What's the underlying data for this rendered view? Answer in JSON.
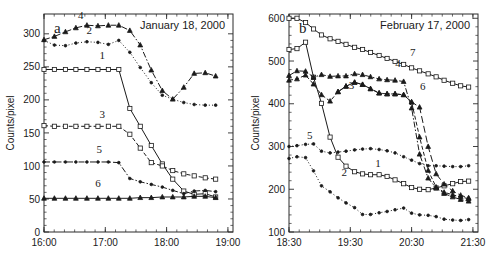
{
  "figure": {
    "background": "#ffffff",
    "ink_color": "#1a1a1a",
    "panel_count": 2
  },
  "chart_data": [
    {
      "type": "line",
      "panel_letter": "a",
      "title": "January 18, 2000",
      "xlabel": "",
      "ylabel": "Counts/pixel",
      "ylim": [
        0,
        330
      ],
      "yticks": [
        0,
        50,
        100,
        150,
        200,
        250,
        300
      ],
      "ytick_labels": [
        "0",
        "50",
        "100",
        "150",
        "200",
        "250",
        "300"
      ],
      "xlim": [
        "16:00",
        "19:05"
      ],
      "xticks": [
        "16:00",
        "17:00",
        "18:00",
        "19:00"
      ],
      "xtick_labels": [
        "16:00",
        "17:00",
        "18:00",
        "19:00"
      ],
      "xtick_hours": [
        16.0,
        17.0,
        18.0,
        19.0
      ],
      "xlim_hours": [
        16.0,
        19.083
      ],
      "grid": false,
      "legend": "inline-curve-numbers",
      "series": [
        {
          "name": "1",
          "label": "1",
          "style": "solid",
          "marker": "square",
          "label_pos": {
            "x": 16.95,
            "y": 262
          },
          "x": [
            16.0,
            16.17,
            16.35,
            16.52,
            16.7,
            16.88,
            17.05,
            17.22,
            17.4,
            17.57,
            17.75,
            17.93,
            18.1,
            18.28,
            18.45,
            18.63,
            18.8
          ],
          "y": [
            246,
            246,
            246,
            246,
            246,
            246,
            246,
            246,
            187,
            160,
            131,
            103,
            80,
            62,
            57,
            58,
            53
          ]
        },
        {
          "name": "2",
          "label": "2",
          "style": "dotted",
          "marker": "dot",
          "label_pos": {
            "x": 16.74,
            "y": 300
          },
          "x": [
            16.0,
            16.17,
            16.35,
            16.52,
            16.7,
            16.88,
            17.05,
            17.22,
            17.4,
            17.57,
            17.75,
            17.93,
            18.1,
            18.28,
            18.45,
            18.63,
            18.8
          ],
          "y": [
            290,
            283,
            282,
            286,
            288,
            287,
            284,
            290,
            272,
            249,
            226,
            207,
            201,
            196,
            193,
            192,
            192
          ]
        },
        {
          "name": "3",
          "label": "3",
          "style": "dashed",
          "marker": "square",
          "label_pos": {
            "x": 16.95,
            "y": 172
          },
          "x": [
            16.0,
            16.17,
            16.35,
            16.52,
            16.7,
            16.88,
            17.05,
            17.22,
            17.4,
            17.57,
            17.75,
            17.93,
            18.1,
            18.28,
            18.45,
            18.63,
            18.8
          ],
          "y": [
            161,
            160,
            160,
            160,
            160,
            160,
            160,
            160,
            148,
            127,
            105,
            100,
            93,
            88,
            85,
            82,
            80
          ]
        },
        {
          "name": "4",
          "label": "4",
          "style": "dashdot",
          "marker": "triangle",
          "label_pos": {
            "x": 16.6,
            "y": 322
          },
          "x": [
            16.0,
            16.17,
            16.35,
            16.52,
            16.7,
            16.88,
            17.05,
            17.22,
            17.4,
            17.57,
            17.75,
            17.93,
            18.1,
            18.28,
            18.45,
            18.63,
            18.8
          ],
          "y": [
            291,
            296,
            303,
            309,
            313,
            312,
            313,
            313,
            305,
            283,
            245,
            214,
            201,
            219,
            240,
            241,
            236
          ]
        },
        {
          "name": "5",
          "label": "5",
          "style": "dashdot",
          "marker": "dot",
          "label_pos": {
            "x": 16.9,
            "y": 120
          },
          "x": [
            16.0,
            16.17,
            16.35,
            16.52,
            16.7,
            16.88,
            17.05,
            17.22,
            17.4,
            17.57,
            17.75,
            17.93,
            18.1,
            18.28,
            18.45,
            18.63,
            18.8
          ],
          "y": [
            106,
            106,
            106,
            106,
            106,
            106,
            106,
            105,
            81,
            76,
            72,
            68,
            63,
            58,
            62,
            63,
            61
          ]
        },
        {
          "name": "6",
          "label": "6",
          "style": "solid",
          "marker": "triangle",
          "label_pos": {
            "x": 16.88,
            "y": 68
          },
          "x": [
            16.0,
            16.17,
            16.35,
            16.52,
            16.7,
            16.88,
            17.05,
            17.22,
            17.4,
            17.57,
            17.75,
            17.93,
            18.1,
            18.28,
            18.45,
            18.63,
            18.8
          ],
          "y": [
            51,
            51,
            51,
            51,
            51,
            51,
            51,
            51,
            51,
            52,
            52,
            53,
            53,
            53,
            54,
            54,
            52
          ]
        }
      ]
    },
    {
      "type": "line",
      "panel_letter": "b",
      "title": "February 17, 2000",
      "xlabel": "",
      "ylabel": "Counts/pixel",
      "ylim": [
        100,
        610
      ],
      "yticks": [
        100,
        200,
        300,
        400,
        500,
        600
      ],
      "ytick_labels": [
        "100",
        "200",
        "300",
        "400",
        "500",
        "600"
      ],
      "xlim": [
        "18:30",
        "21:35"
      ],
      "xticks": [
        "18:30",
        "19:30",
        "20:30",
        "21:30"
      ],
      "xtick_labels": [
        "18:30",
        "19:30",
        "20:30",
        "21:30"
      ],
      "xtick_hours": [
        18.5,
        19.5,
        20.5,
        21.5
      ],
      "xlim_hours": [
        18.5,
        21.583
      ],
      "grid": false,
      "legend": "inline-curve-numbers",
      "series": [
        {
          "name": "1",
          "label": "1",
          "style": "solid",
          "marker": "square",
          "label_pos": {
            "x": 19.95,
            "y": 252
          },
          "x": [
            18.5,
            18.63,
            18.77,
            18.9,
            19.03,
            19.17,
            19.3,
            19.43,
            19.57,
            19.7,
            19.83,
            19.97,
            20.1,
            20.23,
            20.37,
            20.5,
            20.63,
            20.77,
            20.9,
            21.03,
            21.17,
            21.3,
            21.43
          ],
          "y": [
            527,
            529,
            544,
            462,
            401,
            322,
            275,
            254,
            241,
            236,
            234,
            234,
            230,
            222,
            213,
            204,
            200,
            199,
            203,
            208,
            213,
            218,
            219
          ]
        },
        {
          "name": "2",
          "label": "2",
          "style": "dotted",
          "marker": "dot",
          "label_pos": {
            "x": 19.4,
            "y": 232
          },
          "x": [
            18.5,
            18.63,
            18.77,
            18.9,
            19.03,
            19.17,
            19.3,
            19.43,
            19.57,
            19.7,
            19.83,
            19.97,
            20.1,
            20.23,
            20.37,
            20.5,
            20.63,
            20.77,
            20.9,
            21.03,
            21.17,
            21.3,
            21.43
          ],
          "y": [
            272,
            276,
            274,
            243,
            208,
            194,
            180,
            168,
            157,
            141,
            141,
            145,
            148,
            152,
            156,
            144,
            140,
            139,
            136,
            130,
            128,
            127,
            129
          ]
        },
        {
          "name": "3",
          "label": "3",
          "style": "dashed",
          "marker": "triangle",
          "label_pos": {
            "x": 19.52,
            "y": 434
          },
          "x": [
            18.5,
            18.63,
            18.77,
            18.9,
            19.03,
            19.17,
            19.3,
            19.43,
            19.57,
            19.7,
            19.83,
            19.97,
            20.1,
            20.23,
            20.37,
            20.5,
            20.63,
            20.77,
            20.9,
            21.03,
            21.17,
            21.3,
            21.43
          ],
          "y": [
            455,
            458,
            467,
            446,
            421,
            406,
            428,
            441,
            450,
            445,
            435,
            425,
            423,
            423,
            421,
            404,
            322,
            244,
            205,
            193,
            187,
            182,
            178
          ]
        },
        {
          "name": "4",
          "label": "4",
          "style": "dashdot",
          "marker": "triangle",
          "label_pos": {
            "x": 20.28,
            "y": 487
          },
          "x": [
            18.5,
            18.63,
            18.77,
            18.9,
            19.03,
            19.17,
            19.3,
            19.43,
            19.57,
            19.7,
            19.83,
            19.97,
            20.1,
            20.23,
            20.37,
            20.5,
            20.63,
            20.77,
            20.9,
            21.03,
            21.17,
            21.3,
            21.43
          ],
          "y": [
            466,
            477,
            476,
            462,
            468,
            464,
            465,
            465,
            470,
            468,
            463,
            458,
            456,
            455,
            452,
            390,
            282,
            226,
            203,
            190,
            182,
            176,
            172
          ]
        },
        {
          "name": "5",
          "label": "5",
          "style": "dotted",
          "marker": "dot",
          "label_pos": {
            "x": 18.84,
            "y": 318
          },
          "x": [
            18.5,
            18.63,
            18.77,
            18.9,
            19.03,
            19.17,
            19.3,
            19.43,
            19.57,
            19.7,
            19.83,
            19.97,
            20.1,
            20.23,
            20.37,
            20.5,
            20.63,
            20.77,
            20.9,
            21.03,
            21.17,
            21.3,
            21.43
          ],
          "y": [
            300,
            302,
            305,
            306,
            289,
            285,
            287,
            289,
            292,
            294,
            295,
            293,
            290,
            285,
            276,
            268,
            260,
            255,
            255,
            254,
            253,
            253,
            255
          ]
        },
        {
          "name": "6",
          "label": "6",
          "style": "longdash",
          "marker": "triangle",
          "label_pos": {
            "x": 20.68,
            "y": 432
          },
          "x": [
            19.3,
            19.43,
            19.57,
            19.7,
            19.83,
            19.97,
            20.1,
            20.23,
            20.37,
            20.5,
            20.63,
            20.77,
            20.9,
            21.03,
            21.17,
            21.3,
            21.43
          ],
          "y": [
            428,
            441,
            450,
            445,
            435,
            425,
            423,
            423,
            421,
            404,
            392,
            300,
            236,
            212,
            196,
            186,
            180
          ]
        },
        {
          "name": "7",
          "label": "7",
          "style": "solid",
          "marker": "square",
          "label_pos": {
            "x": 20.52,
            "y": 512
          },
          "x": [
            18.5,
            18.63,
            18.77,
            18.9,
            19.03,
            19.17,
            19.3,
            19.43,
            19.57,
            19.7,
            19.83,
            19.97,
            20.1,
            20.23,
            20.37,
            20.5,
            20.63,
            20.77,
            20.9,
            21.03,
            21.17,
            21.3,
            21.43
          ],
          "y": [
            600,
            600,
            590,
            575,
            561,
            552,
            546,
            539,
            532,
            527,
            520,
            513,
            506,
            499,
            492,
            484,
            477,
            470,
            463,
            455,
            448,
            442,
            439
          ]
        }
      ]
    }
  ]
}
